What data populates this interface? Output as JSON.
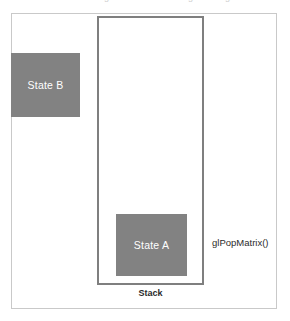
{
  "figure": {
    "type": "matrix-stack-diagram",
    "background_color": "#ffffff",
    "outer_frame": {
      "name": "diagram-border",
      "border_color": "#c9c9c9"
    },
    "stack": {
      "label": "Stack",
      "border_color": "#7f7f7f"
    },
    "boxes": [
      {
        "id": "state-b",
        "label": "State B",
        "fill_color": "#828282",
        "text_color": "#ffffff",
        "position": "outside-stack-top-left"
      },
      {
        "id": "state-a",
        "label": "State A",
        "fill_color": "#828282",
        "text_color": "#ffffff",
        "position": "inside-stack-bottom"
      }
    ],
    "annotations": {
      "operation": "glPopMatrix()"
    },
    "top_edge_artifacts": [
      {
        "text": "g",
        "left": 104
      },
      {
        "text": "g",
        "left": 188
      },
      {
        "text": "g",
        "left": 225
      }
    ]
  }
}
